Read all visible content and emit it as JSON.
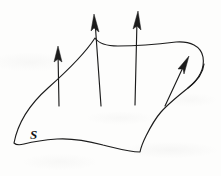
{
  "figure": {
    "kind": "vector-field-through-surface",
    "caption_label": "S",
    "label_position": {
      "x": 30,
      "y": 128
    },
    "ink_color": "#1c1c1c",
    "background_color": "#fdfdfc",
    "canvas": {
      "width": 221,
      "height": 176
    }
  },
  "surface": {
    "name": "S",
    "outline_path": "M 14 143 C 18 122 30 104 48 88 C 66 72 84 55 95 38 C 99 44 106 46 118 46 C 136 46 160 44 176 42 C 190 41 201 46 203 57 C 205 69 198 80 188 88 C 178 96 168 104 161 112 C 154 120 150 128 146 136 C 143 142 141 147 140 152 C 128 152 116 148 103 145 C 88 141 72 138 57 139 C 44 140 32 142 24 144 C 20 145 16 145 14 143 Z",
    "fold_path": "M 188 88 C 196 82 203 74 204 64"
  },
  "vectors": [
    {
      "id": "normal-vector-1",
      "label": "normal-vector-left",
      "orientation": "vertical",
      "tail": {
        "x": 59,
        "y": 106
      },
      "tip": {
        "x": 58,
        "y": 47
      }
    },
    {
      "id": "normal-vector-2",
      "label": "normal-vector-center-left",
      "orientation": "vertical",
      "tail": {
        "x": 101,
        "y": 106
      },
      "tip": {
        "x": 94,
        "y": 15
      }
    },
    {
      "id": "normal-vector-3",
      "label": "normal-vector-center-right",
      "orientation": "vertical",
      "tail": {
        "x": 135,
        "y": 105
      },
      "tip": {
        "x": 138,
        "y": 12
      }
    },
    {
      "id": "normal-vector-4",
      "label": "normal-vector-right-diagonal",
      "orientation": "diagonal",
      "tail": {
        "x": 165,
        "y": 106
      },
      "tip": {
        "x": 188,
        "y": 57
      }
    }
  ]
}
